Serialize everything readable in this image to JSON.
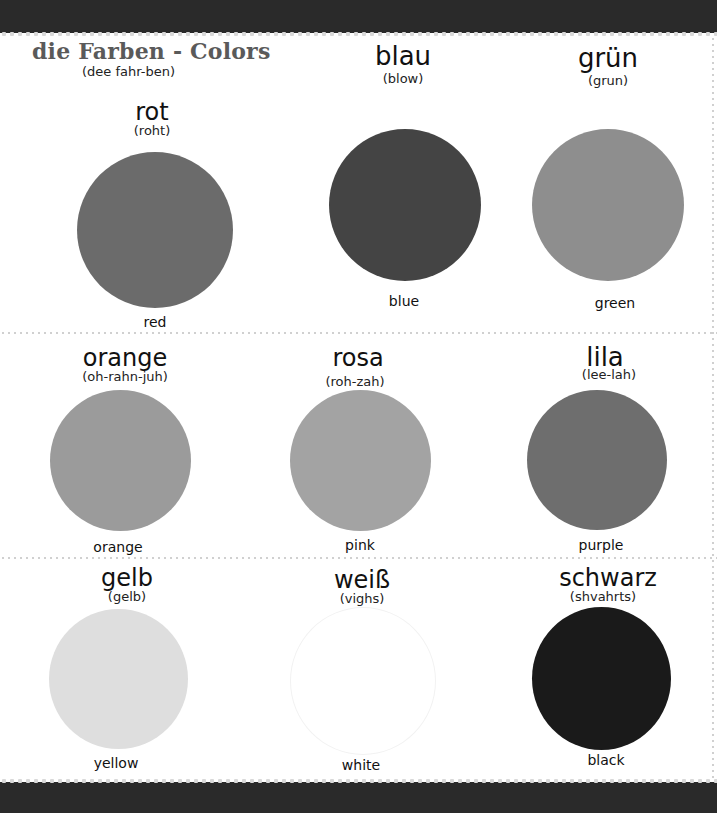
{
  "header": {
    "title": "die Farben - Colors",
    "pronunciation": "(dee fahr-ben)"
  },
  "colors": [
    {
      "german": "rot",
      "pronunciation": "(roht)",
      "english": "red",
      "swatch": "#6b6b6b"
    },
    {
      "german": "blau",
      "pronunciation": "(blow)",
      "english": "blue",
      "swatch": "#444444"
    },
    {
      "german": "grün",
      "pronunciation": "(grun)",
      "english": "green",
      "swatch": "#8e8e8e"
    },
    {
      "german": "orange",
      "pronunciation": "(oh-rahn-juh)",
      "english": "orange",
      "swatch": "#9b9b9b"
    },
    {
      "german": "rosa",
      "pronunciation": "(roh-zah)",
      "english": "pink",
      "swatch": "#a3a3a3"
    },
    {
      "german": "lila",
      "pronunciation": "(lee-lah)",
      "english": "purple",
      "swatch": "#6e6e6e"
    },
    {
      "german": "gelb",
      "pronunciation": "(gelb)",
      "english": "yellow",
      "swatch": "#dedede"
    },
    {
      "german": "weiß",
      "pronunciation": "(vighs)",
      "english": "white",
      "swatch": "#ffffff"
    },
    {
      "german": "schwarz",
      "pronunciation": "(shvahrts)",
      "english": "black",
      "swatch": "#1a1a1a"
    }
  ]
}
